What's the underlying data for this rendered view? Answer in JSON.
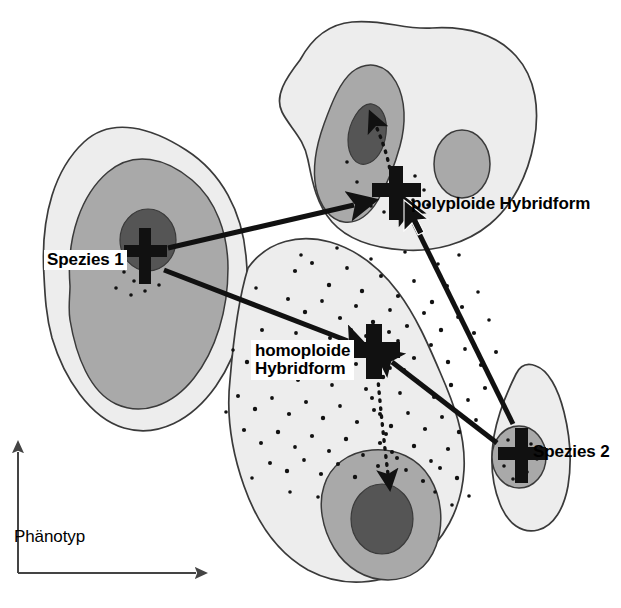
{
  "figure": {
    "type": "diagram",
    "language": "de"
  },
  "axis": {
    "label": "Phänotyp",
    "x_arrow_direction": "right",
    "y_arrow_direction": "up",
    "origin": {
      "x": 18,
      "y": 573
    }
  },
  "labels": {
    "spezies_1": "Spezies 1",
    "spezies_2": "Spezies 2",
    "polyploide": "polyploide Hybridform",
    "homoploide_line1": "homoploide",
    "homoploide_line2": "Hybridform"
  },
  "colors": {
    "outer_contour": "#ededed",
    "mid_contour": "#a9a9a9",
    "peak_contour": "#555555",
    "outline": "#3a3a3a",
    "marker": "#111111",
    "text": "#000000",
    "background": "#ffffff"
  },
  "markers": [
    {
      "name": "spezies-1",
      "x": 147,
      "y": 256
    },
    {
      "name": "polyploide-hybridform",
      "x": 396,
      "y": 191
    },
    {
      "name": "homoploide-hybridform",
      "x": 374,
      "y": 350
    },
    {
      "name": "spezies-2",
      "x": 521,
      "y": 455
    }
  ],
  "arrows": [
    {
      "name": "spezies1-to-polyploide",
      "style": "solid",
      "from": [
        170,
        248
      ],
      "to": [
        358,
        204
      ]
    },
    {
      "name": "spezies1-to-homoploide",
      "style": "solid",
      "from": [
        166,
        270
      ],
      "to": [
        352,
        342
      ]
    },
    {
      "name": "spezies2-to-polyploide",
      "style": "solid",
      "from": [
        512,
        423
      ],
      "to": [
        408,
        213
      ]
    },
    {
      "name": "spezies2-to-homoploide",
      "style": "solid",
      "from": [
        496,
        444
      ],
      "to": [
        390,
        362
      ]
    },
    {
      "name": "polyploide-to-peak",
      "style": "dotted",
      "from": [
        391,
        178
      ],
      "to": [
        378,
        122
      ]
    },
    {
      "name": "homoploide-to-peak",
      "style": "dotted",
      "from": [
        378,
        366
      ],
      "to": [
        388,
        478
      ]
    }
  ],
  "cursor": {
    "name": "mouse-pointer",
    "x": 410,
    "y": 208
  },
  "scatter": {
    "description": "hybrid individuals in the central zone",
    "count": 240
  }
}
